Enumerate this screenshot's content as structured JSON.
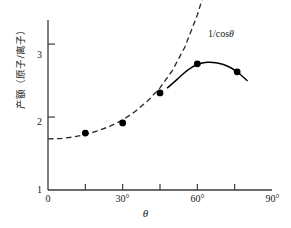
{
  "chart_data": {
    "type": "line",
    "title": "",
    "xlabel": "θ",
    "ylabel": "产额（原子/离子）",
    "xlim": [
      0,
      90
    ],
    "ylim": [
      1,
      3.33
    ],
    "grid": false,
    "legend": "none",
    "x_tick_labels": [
      "0",
      "30°",
      "60°",
      "90°"
    ],
    "x_tick_values": [
      0,
      30,
      60,
      90
    ],
    "x_minor_tick_values": [
      15,
      45,
      75
    ],
    "y_tick_labels": [
      "1",
      "2",
      "3"
    ],
    "y_tick_values": [
      1,
      2,
      3
    ],
    "series": [
      {
        "name": "实验数据点",
        "style": "markers",
        "marker": "filled-circle",
        "x": [
          15,
          30,
          45,
          60,
          76
        ],
        "values": [
          1.78,
          1.92,
          2.33,
          2.73,
          2.62
        ]
      },
      {
        "name": "1/cosθ",
        "style": "dashed",
        "x": [
          0,
          5,
          10,
          15,
          20,
          25,
          30,
          35,
          40,
          45,
          50,
          55,
          60,
          62,
          64,
          66
        ],
        "values": [
          1.7,
          1.705,
          1.725,
          1.76,
          1.81,
          1.875,
          1.96,
          2.075,
          2.22,
          2.4,
          2.64,
          2.96,
          3.4,
          3.62,
          3.88,
          4.18
        ]
      },
      {
        "name": "实测曲线",
        "style": "solid",
        "x": [
          48,
          52,
          56,
          60,
          64,
          68,
          72,
          76,
          80
        ],
        "values": [
          2.4,
          2.52,
          2.64,
          2.72,
          2.75,
          2.74,
          2.7,
          2.62,
          2.5
        ]
      }
    ],
    "annotations": [
      {
        "text": "1/cosθ",
        "text_prefix": "1/cos",
        "text_italic": "θ",
        "x": 66,
        "y": 3.3
      }
    ],
    "colors": {
      "axis": "#3a3a3a",
      "data_marker": "#000000",
      "dashed_curve": "#2b2b2b",
      "solid_curve": "#000000",
      "background": "#ffffff",
      "text": "#1a1a1a"
    }
  },
  "axis_titles": {
    "x": "θ",
    "y": "产额（原子/离子）"
  },
  "y_ticks": [
    {
      "label": "3"
    },
    {
      "label": "2"
    },
    {
      "label": "1"
    }
  ],
  "x_ticks": [
    {
      "label": "0"
    },
    {
      "label": "30°"
    },
    {
      "label": "60°"
    },
    {
      "label": "90°"
    }
  ],
  "annotation": {
    "prefix": "1/cos",
    "symbol": "θ"
  }
}
